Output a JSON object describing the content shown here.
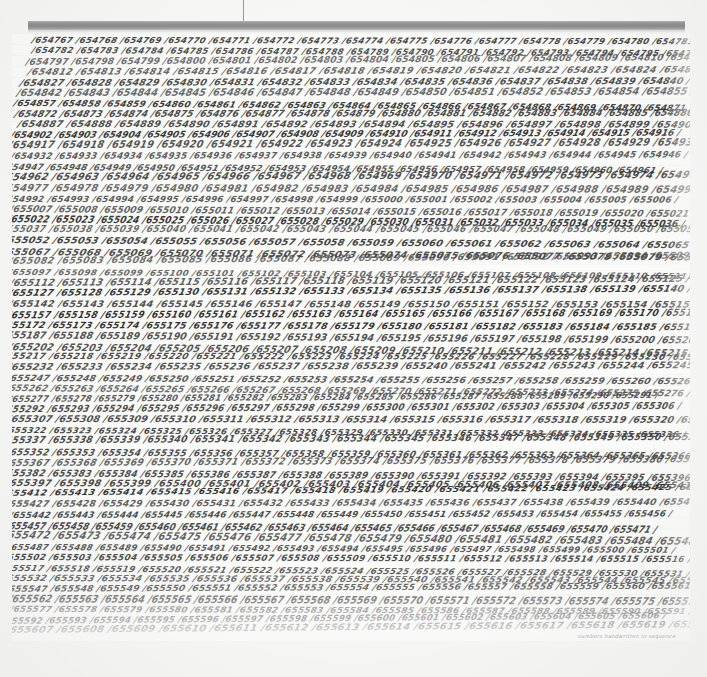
{
  "scene": {
    "background_color": "#f7f7f6",
    "description": "Photograph of a conceptual painting: a square canvas covered edge to edge with small handwritten sequential integers separated by slashes, suspended from a gray gallery rail by a thin wire."
  },
  "mount": {
    "rail_name": "hanging-rail",
    "rail_color": "#8a8a8a",
    "wire_name": "hanging-wire",
    "wire_color": "#9a9a9a"
  },
  "artwork": {
    "canvas_color": "#fbfbfa",
    "ink_color": "#3b3b3b",
    "separator": "/",
    "first_number": 654767,
    "last_number": 656170,
    "numbers_per_line": 15,
    "line_count": 57,
    "caption": "numbers handwritten in sequence"
  },
  "chart_data": {
    "type": "table",
    "xlabel": "",
    "ylabel": "",
    "categories": [
      "line 1",
      "line 5",
      "line 10",
      "line 15",
      "line 20",
      "line 25",
      "line 30",
      "line 35",
      "line 40",
      "line 45",
      "line 50",
      "line 57"
    ],
    "values": [
      654767,
      654827,
      654902,
      654977,
      655052,
      655127,
      655202,
      655277,
      655352,
      655427,
      655502,
      656170
    ],
    "notes": [
      "Row 1 begins 654767 / 654768 / 654769 / 654770 / 654771 / 654772 / 654773 / 654774 / 654775",
      "Mid canvas reads approximately 655400 - 655600",
      "Final visible row ends near 656160 / 656170"
    ]
  }
}
